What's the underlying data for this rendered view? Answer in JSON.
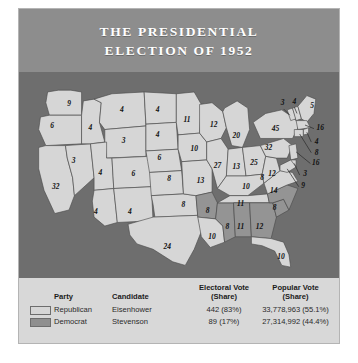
{
  "figure": {
    "title_line1": "THE PRESIDENTIAL",
    "title_line2": "ELECTION OF 1952"
  },
  "colors": {
    "header_band": "#8d8d8d",
    "panel": "#d8d8d8",
    "ocean": "#6e6e6e",
    "republican": "#d6d6d6",
    "democrat": "#949494",
    "state_border": "#4a4a4a"
  },
  "legend": {
    "headers": {
      "party": "Party",
      "candidate": "Candidate",
      "electoral_line1": "Electoral Vote",
      "electoral_line2": "(Share)",
      "popular_line1": "Popular Vote",
      "popular_line2": "(Share)"
    },
    "rows": [
      {
        "swatch": "republican-swatch",
        "party": "Republican",
        "candidate": "Eisenhower",
        "electoral": "442 (83%)",
        "popular": "33,778,963 (55.1%)"
      },
      {
        "swatch": "democrat-swatch",
        "party": "Democrat",
        "candidate": "Stevenson",
        "electoral": "89 (17%)",
        "popular": "27,314,992 (44.4%)"
      }
    ]
  },
  "chart_data": {
    "type": "map",
    "title": "THE PRESIDENTIAL ELECTION OF 1952",
    "legend_position": "bottom",
    "categories": [
      "Republican",
      "Democrat"
    ],
    "series": [
      {
        "name": "Republican",
        "candidate": "Eisenhower",
        "electoral_votes": 442,
        "electoral_share": "83%",
        "popular_votes": "33,778,963",
        "popular_share": "55.1%",
        "color": "#d6d6d6"
      },
      {
        "name": "Democrat",
        "candidate": "Stevenson",
        "electoral_votes": 89,
        "electoral_share": "17%",
        "popular_votes": "27,314,992",
        "popular_share": "44.4%",
        "color": "#949494"
      }
    ],
    "states": [
      {
        "code": "WA",
        "votes": 9,
        "party": "Republican",
        "lx": 56,
        "ly": 26
      },
      {
        "code": "OR",
        "votes": 6,
        "party": "Republican",
        "lx": 37,
        "ly": 50
      },
      {
        "code": "CA",
        "votes": 32,
        "party": "Republican",
        "lx": 41,
        "ly": 118
      },
      {
        "code": "NV",
        "votes": 3,
        "party": "Republican",
        "lx": 61,
        "ly": 90
      },
      {
        "code": "ID",
        "votes": 4,
        "party": "Republican",
        "lx": 80,
        "ly": 53
      },
      {
        "code": "MT",
        "votes": 4,
        "party": "Republican",
        "lx": 115,
        "ly": 32
      },
      {
        "code": "WY",
        "votes": 3,
        "party": "Republican",
        "lx": 117,
        "ly": 67
      },
      {
        "code": "UT",
        "votes": 4,
        "party": "Republican",
        "lx": 91,
        "ly": 103
      },
      {
        "code": "CO",
        "votes": 6,
        "party": "Republican",
        "lx": 128,
        "ly": 104
      },
      {
        "code": "AZ",
        "votes": 4,
        "party": "Republican",
        "lx": 86,
        "ly": 146
      },
      {
        "code": "NM",
        "votes": 4,
        "party": "Republican",
        "lx": 124,
        "ly": 147
      },
      {
        "code": "ND",
        "votes": 4,
        "party": "Republican",
        "lx": 155,
        "ly": 32
      },
      {
        "code": "SD",
        "votes": 4,
        "party": "Republican",
        "lx": 155,
        "ly": 60
      },
      {
        "code": "NE",
        "votes": 6,
        "party": "Republican",
        "lx": 157,
        "ly": 86
      },
      {
        "code": "KS",
        "votes": 8,
        "party": "Republican",
        "lx": 168,
        "ly": 110
      },
      {
        "code": "OK",
        "votes": 8,
        "party": "Republican",
        "lx": 184,
        "ly": 139
      },
      {
        "code": "TX",
        "votes": 24,
        "party": "Republican",
        "lx": 166,
        "ly": 186
      },
      {
        "code": "MN",
        "votes": 11,
        "party": "Republican",
        "lx": 188,
        "ly": 44
      },
      {
        "code": "IA",
        "votes": 10,
        "party": "Republican",
        "lx": 196,
        "ly": 76
      },
      {
        "code": "MO",
        "votes": 13,
        "party": "Republican",
        "lx": 203,
        "ly": 112
      },
      {
        "code": "AR",
        "votes": 8,
        "party": "Democrat",
        "lx": 211,
        "ly": 145
      },
      {
        "code": "LA",
        "votes": 10,
        "party": "Republican",
        "lx": 216,
        "ly": 174
      },
      {
        "code": "MS",
        "votes": 8,
        "party": "Democrat",
        "lx": 233,
        "ly": 163
      },
      {
        "code": "WI",
        "votes": 12,
        "party": "Republican",
        "lx": 218,
        "ly": 49
      },
      {
        "code": "IL",
        "votes": 27,
        "party": "Republican",
        "lx": 222,
        "ly": 95
      },
      {
        "code": "MI",
        "votes": 20,
        "party": "Republican",
        "lx": 243,
        "ly": 61
      },
      {
        "code": "IN",
        "votes": 13,
        "party": "Republican",
        "lx": 243,
        "ly": 96
      },
      {
        "code": "OH",
        "votes": 25,
        "party": "Republican",
        "lx": 263,
        "ly": 92
      },
      {
        "code": "KY",
        "votes": 10,
        "party": "Republican",
        "lx": 254,
        "ly": 119
      },
      {
        "code": "TN",
        "votes": 11,
        "party": "Republican",
        "lx": 248,
        "ly": 138
      },
      {
        "code": "AL",
        "votes": 11,
        "party": "Democrat",
        "lx": 248,
        "ly": 163
      },
      {
        "code": "GA",
        "votes": 12,
        "party": "Democrat",
        "lx": 269,
        "ly": 163
      },
      {
        "code": "FL",
        "votes": 10,
        "party": "Republican",
        "lx": 293,
        "ly": 197
      },
      {
        "code": "SC",
        "votes": 8,
        "party": "Democrat",
        "lx": 286,
        "ly": 142
      },
      {
        "code": "NC",
        "votes": 14,
        "party": "Democrat",
        "lx": 285,
        "ly": 123
      },
      {
        "code": "VA",
        "votes": 12,
        "party": "Republican",
        "lx": 283,
        "ly": 104
      },
      {
        "code": "WV",
        "votes": 8,
        "party": "Republican",
        "lx": 272,
        "ly": 108
      },
      {
        "code": "PA",
        "votes": 32,
        "party": "Republican",
        "lx": 279,
        "ly": 75
      },
      {
        "code": "NY",
        "votes": 45,
        "party": "Republican",
        "lx": 287,
        "ly": 54
      },
      {
        "code": "VT",
        "votes": 3,
        "party": "Republican",
        "lx": 295,
        "ly": 25
      },
      {
        "code": "NH",
        "votes": 4,
        "party": "Republican",
        "lx": 308,
        "ly": 23
      },
      {
        "code": "ME",
        "votes": 5,
        "party": "Republican",
        "lx": 328,
        "ly": 28
      },
      {
        "code": "MA",
        "votes": 16,
        "party": "Republican",
        "lx": 337,
        "ly": 53
      },
      {
        "code": "RI",
        "votes": 4,
        "party": "Republican",
        "lx": 333,
        "ly": 68
      },
      {
        "code": "CT",
        "votes": 8,
        "party": "Republican",
        "lx": 333,
        "ly": 80
      },
      {
        "code": "NJ",
        "votes": 16,
        "party": "Republican",
        "lx": 332,
        "ly": 92
      },
      {
        "code": "DE",
        "votes": 3,
        "party": "Republican",
        "lx": 320,
        "ly": 104
      },
      {
        "code": "MD",
        "votes": 9,
        "party": "Republican",
        "lx": 318,
        "ly": 117
      }
    ]
  }
}
